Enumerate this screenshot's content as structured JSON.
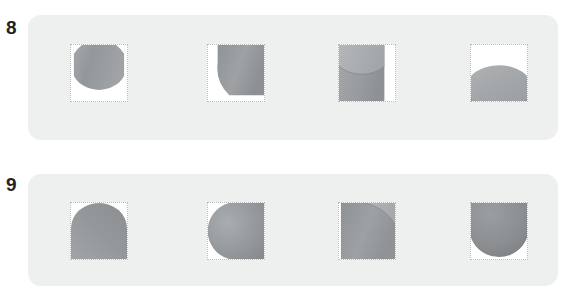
{
  "page": {
    "background": "#ffffff",
    "width": 574,
    "height": 300
  },
  "colors": {
    "panel_background": "#eef0f0",
    "cell_background": "#ffffff",
    "cell_border": "#b9bdbd",
    "label_text": "#232323",
    "gray_light": "#c9cbcb",
    "gray_mid": "#9b9ea0",
    "gray_dark": "#7e8285",
    "gray_darker": "#72767a"
  },
  "rows": [
    {
      "label": "8",
      "label_x": 6,
      "label_y": 18,
      "panel": {
        "x": 28,
        "y": 15,
        "width": 530,
        "height": 125
      },
      "cells": [
        {
          "x": 70,
          "y": 44,
          "shape": "ellipse-cut-corners",
          "name": "shape-cell-8-1"
        },
        {
          "x": 207,
          "y": 44,
          "shape": "quarter-notch-bottom-left",
          "name": "shape-cell-8-2"
        },
        {
          "x": 338,
          "y": 44,
          "shape": "cylinder-top-right-strip",
          "name": "shape-cell-8-3"
        },
        {
          "x": 470,
          "y": 44,
          "shape": "wide-ellipse-bottom",
          "name": "shape-cell-8-4"
        }
      ]
    },
    {
      "label": "9",
      "label_x": 6,
      "label_y": 175,
      "panel": {
        "x": 28,
        "y": 174,
        "width": 530,
        "height": 112
      },
      "cells": [
        {
          "x": 70,
          "y": 202,
          "shape": "dome-bottom",
          "name": "shape-cell-9-1"
        },
        {
          "x": 207,
          "y": 202,
          "shape": "circle-clipped-right",
          "name": "shape-cell-9-2"
        },
        {
          "x": 338,
          "y": 202,
          "shape": "concave-arc-top",
          "name": "shape-cell-9-3"
        },
        {
          "x": 470,
          "y": 202,
          "shape": "circle-bottom-arc",
          "name": "shape-cell-9-4"
        }
      ]
    }
  ]
}
